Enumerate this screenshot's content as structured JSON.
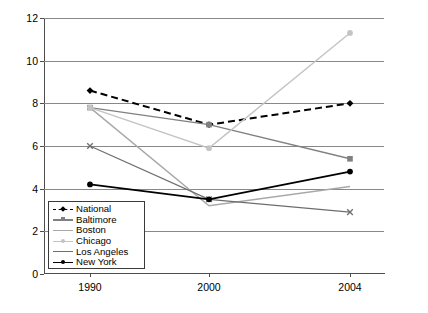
{
  "chart_data": {
    "type": "line",
    "title": "",
    "xlabel": "",
    "ylabel": "",
    "categories": [
      "1990",
      "2000",
      "2004"
    ],
    "x_tick_labels": [
      "1990",
      "2000",
      "2004"
    ],
    "y_tick_labels": [
      "0",
      "2",
      "4",
      "6",
      "8",
      "10",
      "12"
    ],
    "y_ticks": [
      0,
      2,
      4,
      6,
      8,
      10,
      12
    ],
    "ylim": [
      0,
      12
    ],
    "grid": "horizontal",
    "legend_position": "lower-left-inside",
    "series": [
      {
        "name": "National",
        "values": [
          8.6,
          7.0,
          8.0
        ],
        "color": "#000000",
        "line_style": "dashed",
        "marker": "diamond",
        "line_width": 2.0
      },
      {
        "name": "Baltimore",
        "values": [
          7.8,
          7.0,
          5.4
        ],
        "color": "#808080",
        "line_style": "solid",
        "marker": "square",
        "line_width": 1.4
      },
      {
        "name": "Boston",
        "values": [
          7.8,
          3.2,
          4.1
        ],
        "color": "#a8a8a8",
        "line_style": "solid",
        "marker": "none",
        "line_width": 1.4
      },
      {
        "name": "Chicago",
        "values": [
          7.8,
          5.9,
          11.3
        ],
        "color": "#c4c4c4",
        "line_style": "solid",
        "marker": "circle",
        "line_width": 1.4
      },
      {
        "name": "Los Angeles",
        "values": [
          6.0,
          3.5,
          2.9
        ],
        "color": "#6e6e6e",
        "line_style": "solid",
        "marker": "x",
        "line_width": 1.2
      },
      {
        "name": "New York",
        "values": [
          4.2,
          3.5,
          4.8
        ],
        "color": "#000000",
        "line_style": "solid",
        "marker": "circle",
        "line_width": 1.8
      }
    ]
  },
  "legend": {
    "items": [
      {
        "label": "National"
      },
      {
        "label": "Baltimore"
      },
      {
        "label": "Boston"
      },
      {
        "label": "Chicago"
      },
      {
        "label": "Los Angeles"
      },
      {
        "label": "New York"
      }
    ]
  },
  "caption": {
    "text": ""
  }
}
